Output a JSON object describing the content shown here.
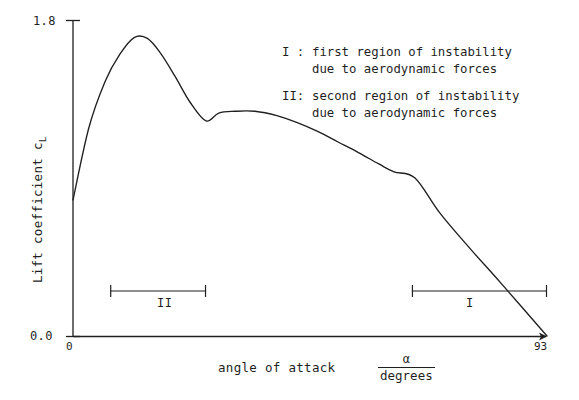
{
  "figure": {
    "background_color": "#ffffff",
    "ink_color": "#1f1f1f"
  },
  "axes": {
    "y_title_main": "Lift coefficient c",
    "y_title_sub": "L",
    "y_max_label": "1.8",
    "y_min_label": "0.0",
    "x_min_label": "0",
    "x_max_label": "93",
    "x_title": "angle of attack",
    "x_unit_numerator": "α",
    "x_unit_denominator": "degrees"
  },
  "legend": {
    "entries": [
      {
        "key": "I :",
        "line1": "first region of instability",
        "line2": "due to aerodynamic forces"
      },
      {
        "key": "II:",
        "line1": "second region of instability",
        "line2": "due to aerodynamic forces"
      }
    ]
  },
  "region_markers": [
    {
      "label": "II",
      "x_start": 7.3,
      "x_end": 26.1
    },
    {
      "label": "I",
      "x_start": 66.5,
      "x_end": 93.0
    }
  ],
  "chart_data": {
    "type": "line",
    "title": "",
    "xlabel": "angle of attack  α / degrees",
    "ylabel": "Lift coefficient c_L",
    "xlim": [
      0,
      93
    ],
    "ylim": [
      0.0,
      1.8
    ],
    "xticks": [
      0,
      93
    ],
    "xticklabels": [
      "0",
      "93"
    ],
    "yticks": [
      0.0,
      1.8
    ],
    "yticklabels": [
      "0.0",
      "1.8"
    ],
    "grid": false,
    "legend_position": "upper right",
    "series": [
      {
        "name": "Lift coefficient curve",
        "color": "#1f1f1f",
        "x": [
          0,
          3.1,
          6.3,
          9.2,
          12.0,
          14.6,
          17.2,
          20.0,
          23.0,
          26.1,
          28.6,
          31.8,
          35.7,
          40.0,
          44.0,
          48.0,
          52.0,
          56.0,
          60.0,
          63.0,
          67.1,
          72.0,
          78.0,
          84.0,
          93.0
        ],
        "y": [
          0.775,
          1.185,
          1.45,
          1.605,
          1.7,
          1.695,
          1.61,
          1.48,
          1.33,
          1.225,
          1.27,
          1.28,
          1.28,
          1.255,
          1.215,
          1.165,
          1.105,
          1.045,
          0.98,
          0.935,
          0.9,
          0.7,
          0.495,
          0.3,
          0.0
        ]
      }
    ],
    "annotations": [
      {
        "text": "II",
        "x": 16.5,
        "y": 0.22,
        "kind": "region-label"
      },
      {
        "text": "I",
        "x": 77.5,
        "y": 0.22,
        "kind": "region-label"
      },
      {
        "text": "I : first region of instability due to aerodynamic forces",
        "kind": "legend"
      },
      {
        "text": "II: second region of instability due to aerodynamic forces",
        "kind": "legend"
      }
    ]
  }
}
